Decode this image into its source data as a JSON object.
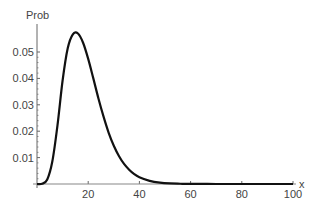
{
  "chart_data": {
    "type": "line",
    "title": "",
    "xlabel": "x",
    "ylabel": "Prob",
    "xlim": [
      0,
      100
    ],
    "ylim": [
      0,
      0.058
    ],
    "grid": false,
    "legend": null,
    "x_ticks": [
      20,
      40,
      60,
      80,
      100
    ],
    "x_tick_labels": [
      "20",
      "40",
      "60",
      "80",
      "100"
    ],
    "y_ticks": [
      0.01,
      0.02,
      0.03,
      0.04,
      0.05
    ],
    "y_tick_labels": [
      "0.01",
      "0.02",
      "0.03",
      "0.04",
      "0.05"
    ],
    "series": [
      {
        "name": "Prob",
        "color": "#111111",
        "x": [
          0,
          2,
          4,
          6,
          8,
          10,
          12,
          14,
          16,
          18,
          20,
          22,
          24,
          26,
          28,
          30,
          32,
          34,
          36,
          38,
          40,
          44,
          48,
          52,
          56,
          60,
          70,
          80,
          90,
          100
        ],
        "values": [
          0,
          0.0001,
          0.0017,
          0.0086,
          0.0222,
          0.0392,
          0.0514,
          0.0567,
          0.057,
          0.0535,
          0.0474,
          0.04,
          0.0324,
          0.0255,
          0.0194,
          0.0145,
          0.0106,
          0.0076,
          0.0054,
          0.0037,
          0.0026,
          0.0012,
          0.0005,
          0.0002,
          0.0001,
          4e-05,
          0,
          0,
          0,
          0
        ]
      }
    ]
  }
}
